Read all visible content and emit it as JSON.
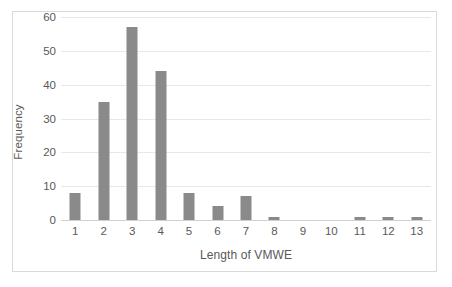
{
  "chart_data": {
    "type": "bar",
    "title": "",
    "xlabel": "Length of VMWE",
    "ylabel": "Frequency",
    "categories": [
      "1",
      "2",
      "3",
      "4",
      "5",
      "6",
      "7",
      "8",
      "9",
      "10",
      "11",
      "12",
      "13"
    ],
    "values": [
      8,
      35,
      57,
      44,
      8,
      4,
      7,
      1,
      0,
      0,
      1,
      1,
      1
    ],
    "yticks": [
      "0",
      "10",
      "20",
      "30",
      "40",
      "50",
      "60"
    ],
    "ytick_values": [
      0,
      10,
      20,
      30,
      40,
      50,
      60
    ],
    "ylim": [
      0,
      60
    ],
    "grid": true,
    "legend": false,
    "legend_position": "none",
    "bar_color": "#8a8a8a",
    "gridline_color": "#e8e8e8",
    "text_color": "#595959",
    "plot_border_color": "#d9d9d9",
    "background_color": "#ffffff"
  }
}
